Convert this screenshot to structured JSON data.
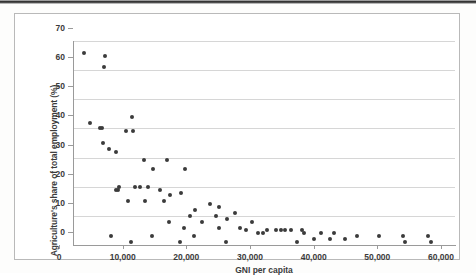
{
  "chart_data": {
    "type": "scatter",
    "title": "",
    "xlabel": "GNI per capita",
    "ylabel": "Agriculture's share of total employment (%)",
    "xlim": [
      0,
      60000
    ],
    "ylim": [
      0,
      70
    ],
    "xticks": [
      "0",
      "10,000",
      "20,000",
      "30,000",
      "40,000",
      "50,000",
      "60,000"
    ],
    "xtick_values": [
      0,
      10000,
      20000,
      30000,
      40000,
      50000,
      60000
    ],
    "yticks": [
      "0",
      "10",
      "20",
      "30",
      "40",
      "50",
      "60",
      "70"
    ],
    "ytick_values": [
      0,
      10,
      20,
      30,
      40,
      50,
      60,
      70
    ],
    "grid": "horizontal",
    "legend": "none",
    "marker": "filled-circle",
    "marker_color": "#3b3b3b",
    "points": [
      [
        1800,
        66
      ],
      [
        5000,
        65
      ],
      [
        4900,
        61
      ],
      [
        9200,
        44
      ],
      [
        2700,
        42
      ],
      [
        4300,
        40
      ],
      [
        4500,
        40
      ],
      [
        8300,
        39
      ],
      [
        9400,
        39
      ],
      [
        4700,
        35
      ],
      [
        5600,
        33
      ],
      [
        6700,
        32
      ],
      [
        14800,
        29
      ],
      [
        11100,
        29
      ],
      [
        12500,
        26
      ],
      [
        17600,
        26
      ],
      [
        7300,
        20
      ],
      [
        9800,
        20
      ],
      [
        10600,
        20
      ],
      [
        11800,
        20
      ],
      [
        6700,
        19
      ],
      [
        7100,
        19
      ],
      [
        13600,
        19
      ],
      [
        17000,
        18
      ],
      [
        15200,
        17
      ],
      [
        8700,
        15
      ],
      [
        11300,
        15
      ],
      [
        14300,
        15
      ],
      [
        21500,
        14
      ],
      [
        23000,
        13
      ],
      [
        19200,
        12
      ],
      [
        25500,
        11
      ],
      [
        22400,
        10
      ],
      [
        18400,
        10
      ],
      [
        24200,
        9
      ],
      [
        15100,
        8
      ],
      [
        20200,
        8
      ],
      [
        28100,
        8
      ],
      [
        17500,
        6
      ],
      [
        22900,
        6
      ],
      [
        26300,
        6
      ],
      [
        27100,
        5
      ],
      [
        30400,
        5
      ],
      [
        31900,
        5
      ],
      [
        32600,
        5
      ],
      [
        33300,
        5
      ],
      [
        34200,
        5
      ],
      [
        35900,
        5
      ],
      [
        36300,
        4
      ],
      [
        38900,
        4
      ],
      [
        41000,
        4
      ],
      [
        29000,
        4
      ],
      [
        29800,
        4
      ],
      [
        5900,
        3
      ],
      [
        12400,
        3
      ],
      [
        19000,
        3
      ],
      [
        44600,
        3
      ],
      [
        48000,
        3
      ],
      [
        51900,
        3
      ],
      [
        55700,
        3
      ],
      [
        37800,
        2
      ],
      [
        40300,
        2
      ],
      [
        42800,
        2
      ],
      [
        9100,
        1
      ],
      [
        16800,
        1
      ],
      [
        24100,
        1
      ],
      [
        35200,
        1
      ],
      [
        52200,
        1
      ],
      [
        56200,
        1
      ]
    ]
  }
}
